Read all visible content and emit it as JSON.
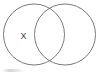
{
  "figure": {
    "type": "venn-diagram",
    "background_color": "#ffffff",
    "stroke_color": "#7a7a7a",
    "label_color": "#3c3c3c",
    "width": 99,
    "height": 73
  },
  "circles": [
    {
      "name": "left-circle",
      "cx": 34,
      "cy": 34.5,
      "r": 30.5
    },
    {
      "name": "right-circle",
      "cx": 65,
      "cy": 34.5,
      "r": 30.5
    }
  ],
  "labels": [
    {
      "name": "region-label-x",
      "text": "X",
      "x": 23.5,
      "y": 37,
      "region": "left-only"
    }
  ]
}
